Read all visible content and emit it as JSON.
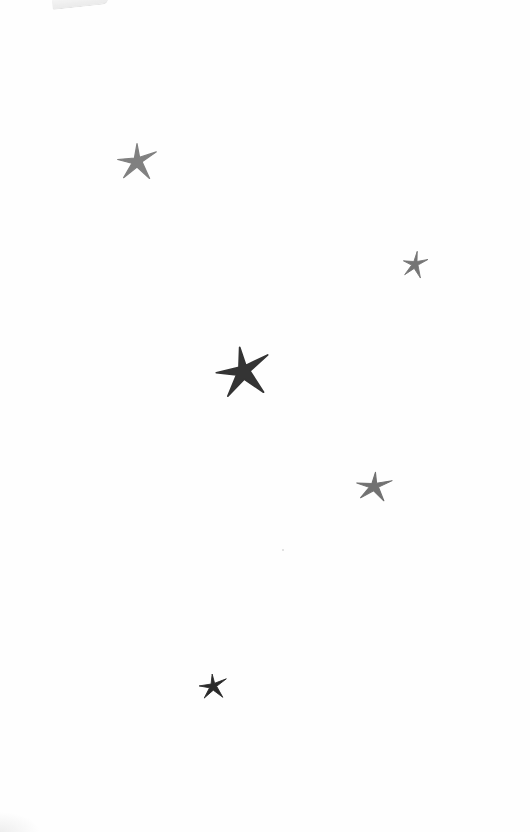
{
  "page": {
    "background": "#fefefe"
  },
  "stars": [
    {
      "id": "star-1",
      "x": 116,
      "y": 142,
      "w": 42,
      "h": 38,
      "color": "#7a7a7a",
      "rotation": 0
    },
    {
      "id": "star-2",
      "x": 402,
      "y": 250,
      "w": 26,
      "h": 28,
      "color": "#6e6e6e",
      "rotation": 10
    },
    {
      "id": "star-3",
      "x": 214,
      "y": 345,
      "w": 58,
      "h": 52,
      "color": "#2a2a2a",
      "rotation": -8
    },
    {
      "id": "star-4",
      "x": 355,
      "y": 471,
      "w": 38,
      "h": 30,
      "color": "#6a6a6a",
      "rotation": 6
    },
    {
      "id": "star-5",
      "x": 198,
      "y": 673,
      "w": 30,
      "h": 26,
      "color": "#1e1e1e",
      "rotation": -4
    }
  ]
}
